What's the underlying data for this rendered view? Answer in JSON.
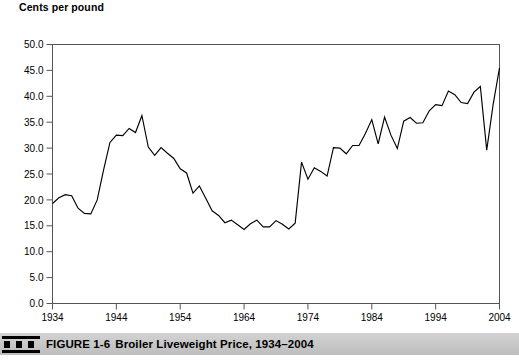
{
  "figure": {
    "caption_label": "FIGURE 1-6",
    "caption_title": "Broiler Liveweight Price, 1934–2004",
    "marker_icon": "three-squares-icon"
  },
  "chart_data": {
    "type": "line",
    "title": "Broiler Liveweight Price, 1934–2004",
    "subtitle": "",
    "xlabel": "",
    "ylabel": "Cents per pound",
    "ylabel_position": "top-left",
    "grid": false,
    "legend": false,
    "legend_position": "none",
    "line_color": "#000000",
    "background_color": "#ffffff",
    "axis_color": "#555555",
    "xlim": [
      1934,
      2004
    ],
    "ylim": [
      0.0,
      50.0
    ],
    "yticks": [
      0.0,
      5.0,
      10.0,
      15.0,
      20.0,
      25.0,
      30.0,
      35.0,
      40.0,
      45.0,
      50.0
    ],
    "ytick_labels": [
      "0.0",
      "5.0",
      "10.0",
      "15.0",
      "20.0",
      "25.0",
      "30.0",
      "35.0",
      "40.0",
      "45.0",
      "50.0"
    ],
    "xticks": [
      1934,
      1944,
      1954,
      1964,
      1974,
      1984,
      1994,
      2004
    ],
    "xtick_labels": [
      "1934",
      "1944",
      "1954",
      "1964",
      "1974",
      "1984",
      "1994",
      "2004"
    ],
    "series": [
      {
        "name": "Broiler liveweight price",
        "x": [
          1934,
          1935,
          1936,
          1937,
          1938,
          1939,
          1940,
          1941,
          1942,
          1943,
          1944,
          1945,
          1946,
          1947,
          1948,
          1949,
          1950,
          1951,
          1952,
          1953,
          1954,
          1955,
          1956,
          1957,
          1958,
          1959,
          1960,
          1961,
          1962,
          1963,
          1964,
          1965,
          1966,
          1967,
          1968,
          1969,
          1970,
          1971,
          1972,
          1973,
          1974,
          1975,
          1976,
          1977,
          1978,
          1979,
          1980,
          1981,
          1982,
          1983,
          1984,
          1985,
          1986,
          1987,
          1988,
          1989,
          1990,
          1991,
          1992,
          1993,
          1994,
          1995,
          1996,
          1997,
          1998,
          1999,
          2000,
          2001,
          2002,
          2003,
          2004
        ],
        "values": [
          19.3,
          20.4,
          21.0,
          20.8,
          18.4,
          17.4,
          17.3,
          20.0,
          25.8,
          31.1,
          32.5,
          32.4,
          33.8,
          33.0,
          36.3,
          30.2,
          28.6,
          30.1,
          29.0,
          28.0,
          26.0,
          25.2,
          21.3,
          22.7,
          20.3,
          17.9,
          17.0,
          15.6,
          16.1,
          15.2,
          14.3,
          15.4,
          16.1,
          14.8,
          14.8,
          16.0,
          15.3,
          14.4,
          15.5,
          27.3,
          24.0,
          26.2,
          25.5,
          24.6,
          30.1,
          30.0,
          28.9,
          30.5,
          30.5,
          32.8,
          35.5,
          30.8,
          36.0,
          32.5,
          29.9,
          35.2,
          35.9,
          34.8,
          34.9,
          37.2,
          38.4,
          38.2,
          41.0,
          40.3,
          38.8,
          38.6,
          40.8,
          41.9,
          29.6,
          38.4,
          45.5
        ]
      }
    ]
  }
}
